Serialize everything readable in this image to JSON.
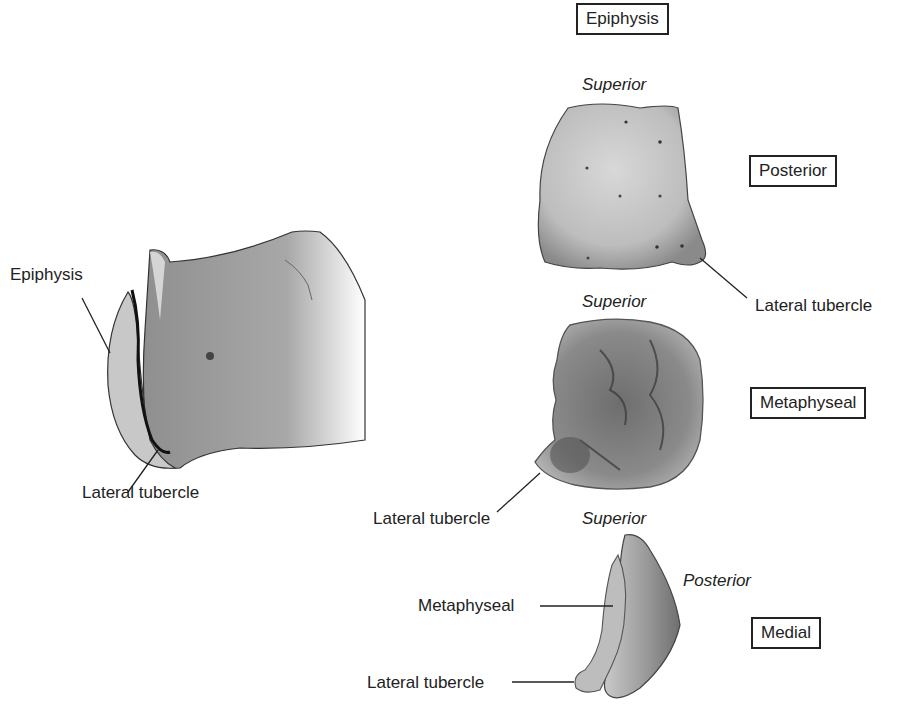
{
  "figure": {
    "left_view": {
      "labels": {
        "epiphysis": "Epiphysis",
        "lateral_tubercle": "Lateral tubercle"
      }
    },
    "posterior_view": {
      "view_box": "Epiphysis",
      "orientation": "Superior",
      "view_label": "Posterior",
      "labels": {
        "lateral_tubercle": "Lateral tubercle"
      }
    },
    "metaphyseal_view": {
      "orientation": "Superior",
      "view_label": "Metaphyseal",
      "labels": {
        "lateral_tubercle": "Lateral tubercle"
      }
    },
    "medial_view": {
      "orientation": "Superior",
      "side_orientation": "Posterior",
      "view_label": "Medial",
      "labels": {
        "metaphyseal": "Metaphyseal",
        "lateral_tubercle": "Lateral tubercle"
      }
    }
  }
}
